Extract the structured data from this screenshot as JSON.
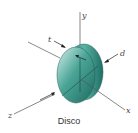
{
  "diagram": {
    "caption": "Disco",
    "axes": {
      "x": "x",
      "y": "y",
      "z": "z"
    },
    "dimensions": {
      "thickness": "t",
      "diameter": "d"
    },
    "colors": {
      "disk_face": "#3a9a8c",
      "disk_edge": "#1f6e63",
      "highlight": "#bfe6df",
      "axis": "#555555"
    }
  }
}
